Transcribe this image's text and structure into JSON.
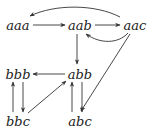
{
  "diagram": {
    "type": "directed-graph",
    "nodes": [
      {
        "id": "aaa",
        "label": "aaa",
        "x": 18,
        "y": 26
      },
      {
        "id": "aab",
        "label": "aab",
        "x": 80,
        "y": 26
      },
      {
        "id": "aac",
        "label": "aac",
        "x": 135,
        "y": 26
      },
      {
        "id": "bbb",
        "label": "bbb",
        "x": 18,
        "y": 75
      },
      {
        "id": "abb",
        "label": "abb",
        "x": 80,
        "y": 75
      },
      {
        "id": "bbc",
        "label": "bbc",
        "x": 18,
        "y": 122
      },
      {
        "id": "abc",
        "label": "abc",
        "x": 80,
        "y": 122
      }
    ],
    "edges": [
      {
        "from": "aaa",
        "to": "aab",
        "style": "straight"
      },
      {
        "from": "aab",
        "to": "aac",
        "style": "straight"
      },
      {
        "from": "aac",
        "to": "aaa",
        "style": "curved-over"
      },
      {
        "from": "aac",
        "to": "aab",
        "style": "curved-under"
      },
      {
        "from": "aab",
        "to": "abb",
        "style": "straight"
      },
      {
        "from": "aac",
        "to": "abc",
        "style": "straight"
      },
      {
        "from": "abb",
        "to": "bbb",
        "style": "straight"
      },
      {
        "from": "bbb",
        "to": "bbc",
        "style": "straight"
      },
      {
        "from": "bbc",
        "to": "bbb",
        "style": "straight"
      },
      {
        "from": "bbc",
        "to": "abb",
        "style": "straight"
      },
      {
        "from": "abc",
        "to": "abb",
        "style": "straight"
      },
      {
        "from": "abb",
        "to": "abc",
        "style": "straight"
      }
    ],
    "colors": {
      "edge": "#333333",
      "text": "#222222",
      "background": "#ffffff"
    }
  }
}
